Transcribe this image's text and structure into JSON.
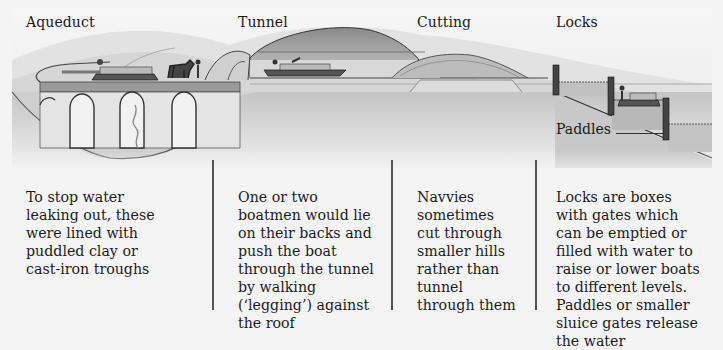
{
  "headings": {
    "aqueduct": "Aqueduct",
    "tunnel": "Tunnel",
    "cutting": "Cutting",
    "locks": "Locks"
  },
  "callouts": {
    "paddles": "Paddles"
  },
  "columns": [
    {
      "topic": "Aqueduct",
      "lines": [
        "To stop water",
        "leaking out, these",
        "were lined with",
        "puddled clay or",
        "cast-iron troughs"
      ]
    },
    {
      "topic": "Tunnel",
      "lines": [
        "One or two",
        "boatmen would lie",
        "on their backs and",
        "push the boat",
        "through the tunnel",
        "by walking",
        "(‘legging’) against",
        "the roof"
      ]
    },
    {
      "topic": "Cutting",
      "lines": [
        "Navvies",
        "sometimes",
        "cut through",
        "smaller hills",
        "rather than",
        "tunnel",
        "through them"
      ]
    },
    {
      "topic": "Locks",
      "lines": [
        "Locks are boxes",
        "with gates which",
        "can be emptied or",
        "filled with water to",
        "raise or lower boats",
        "to different levels.",
        "Paddles or smaller",
        "sluice gates release",
        "the water"
      ]
    }
  ],
  "colors": {
    "background": "#f4f4f4",
    "ground": "#bdbdbd",
    "water": "#9e9e9e",
    "stone": "#d8d8d8",
    "ink": "#1c1c1c"
  }
}
